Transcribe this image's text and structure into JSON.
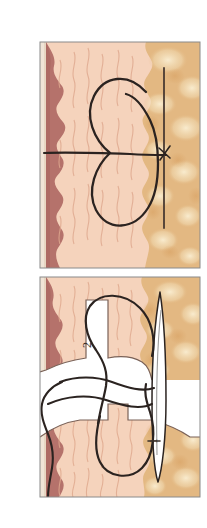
{
  "figure": {
    "panel_count": 2,
    "background_color": "#ffffff",
    "width": 207,
    "height": 528
  },
  "palette": {
    "epidermis": "#f0e4d6",
    "epidermis_line": "#c8b49a",
    "dermis": "#b5726b",
    "dermis_dark": "#a3625c",
    "subcutis": "#f5d3bc",
    "subcutis_shadow": "#e8b69c",
    "subcutis_stria": "#dfa98f",
    "fat": "#e3b882",
    "fat_light": "#f3dcb4",
    "fat_blob": "#f6e6c6",
    "fat_deep": "#d8a164",
    "thread": "#2b2320",
    "needle_fill": "#ffffff",
    "needle_line": "#2b2320",
    "needle_shade": "#9a9a9a",
    "border": "#8a8a8a",
    "wound_gap": "#ffffff",
    "label_text": "#3a2f28"
  },
  "panels": [
    {
      "id": "panel-top",
      "name": "panel-top",
      "index": 1,
      "label": "",
      "x": 40,
      "y": 42,
      "width": 160,
      "height": 226,
      "description": "Intact skin cross-section with figure-of-eight suture loop and straight needle entering fat layer",
      "layers": [
        {
          "name": "epidermis",
          "label": "epidermis"
        },
        {
          "name": "dermis",
          "label": "dermis"
        },
        {
          "name": "subcutaneous-tissue",
          "label": "subcutaneous tissue"
        },
        {
          "name": "adipose-fat",
          "label": "adipose fat"
        }
      ],
      "elements": [
        {
          "name": "suture-loop",
          "label": "figure-of-eight suture loop"
        },
        {
          "name": "horizontal-suture-strand",
          "label": "horizontal suture strand"
        },
        {
          "name": "vertical-needle",
          "label": "vertical needle"
        },
        {
          "name": "knot-crossing",
          "label": "knot crossing point"
        }
      ]
    },
    {
      "id": "panel-bottom",
      "name": "panel-bottom",
      "index": 2,
      "label": "",
      "x": 40,
      "y": 277,
      "width": 160,
      "height": 220,
      "description": "Open wound cross-section with tissue flaps separated, suture threads looped through both flaps and curved needle at right",
      "layers": [
        {
          "name": "epidermis",
          "label": "epidermis"
        },
        {
          "name": "dermis",
          "label": "dermis"
        },
        {
          "name": "subcutaneous-tissue",
          "label": "subcutaneous tissue"
        },
        {
          "name": "adipose-fat",
          "label": "adipose fat"
        }
      ],
      "elements": [
        {
          "name": "wound-gap",
          "label": "wound gap"
        },
        {
          "name": "suture-thread-upper",
          "label": "upper suture thread loop"
        },
        {
          "name": "suture-thread-lower",
          "label": "lower suture thread loop"
        },
        {
          "name": "suture-tail",
          "label": "free suture tail"
        },
        {
          "name": "curved-needle",
          "label": "curved needle"
        }
      ]
    }
  ],
  "annotations": [
    {
      "name": "label-2",
      "text": "2",
      "panel": "panel-bottom",
      "x": 88,
      "y": 345,
      "rotation": -90,
      "font_size": 12
    },
    {
      "name": "label-1",
      "text": "1",
      "panel": "panel-bottom",
      "x": 154,
      "y": 441,
      "rotation": -90,
      "font_size": 11
    }
  ]
}
